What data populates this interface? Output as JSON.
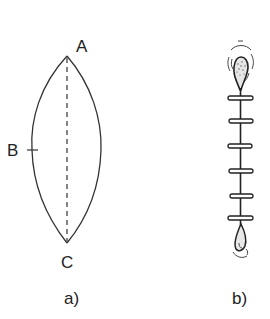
{
  "figure": {
    "panel_a": {
      "caption": "a)",
      "points": {
        "top": "A",
        "side": "B",
        "bottom": "C"
      },
      "description": "Lens-shaped (elliptical) wound outline with dashed central axis from A to C"
    },
    "panel_b": {
      "caption": "b)",
      "description": "Sutured wound with interrupted stitches (rungs) along a vertical line, teardrop ends top and bottom",
      "stitch_count": 6
    }
  },
  "colors": {
    "stroke": "#333333",
    "background": "#ffffff"
  }
}
